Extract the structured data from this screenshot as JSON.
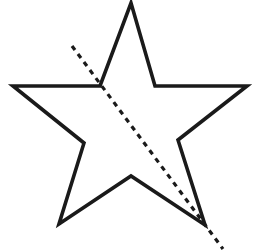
{
  "figure": {
    "background_color": "#ffffff",
    "width": 270,
    "height": 252,
    "star": {
      "name": "five-pointed-star",
      "stroke_color": "#1a1a1a",
      "stroke_width": 3.6,
      "fill": "none",
      "points_count": 5,
      "outer_vertices": [
        {
          "label": "top-point",
          "x": 131,
          "y": 3
        },
        {
          "label": "right-point",
          "x": 247,
          "y": 86
        },
        {
          "label": "bottom-right-point",
          "x": 205,
          "y": 225
        },
        {
          "label": "bottom-left-point",
          "x": 59,
          "y": 224
        },
        {
          "label": "left-point",
          "x": 13,
          "y": 86
        }
      ],
      "inner_vertices": [
        {
          "label": "inner-top-right",
          "x": 155,
          "y": 86
        },
        {
          "label": "inner-right",
          "x": 178,
          "y": 140
        },
        {
          "label": "inner-bottom",
          "x": 131,
          "y": 176
        },
        {
          "label": "inner-left",
          "x": 84,
          "y": 143
        },
        {
          "label": "inner-top-left",
          "x": 100,
          "y": 86
        }
      ],
      "path": "M 131 3 L 155 86 L 247 86 L 178 140 L 205 225 L 131 176 L 59 224 L 84 143 L 13 86 L 100 86 Z"
    },
    "dashed_line": {
      "name": "dashed-diagonal-line",
      "stroke_color": "#1a1a1a",
      "stroke_width": 3.2,
      "dash_length": 5,
      "gap_length": 5,
      "start": {
        "x": 72,
        "y": 46
      },
      "end": {
        "x": 223,
        "y": 249
      },
      "orientation": "upper-left to lower-right diagonal",
      "passes_through": "bottom-right-point"
    }
  }
}
